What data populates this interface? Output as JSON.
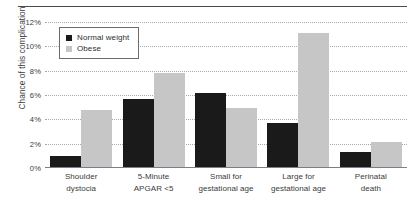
{
  "chart_data": {
    "type": "bar",
    "title": "",
    "xlabel": "",
    "ylabel": "Chance of this complication",
    "ylim": [
      0,
      12
    ],
    "ytick_labels": [
      "12%",
      "10%",
      "8%",
      "6%",
      "4%",
      "2%",
      "0%"
    ],
    "ytick_values": [
      12,
      10,
      8,
      6,
      4,
      2,
      0
    ],
    "grid": true,
    "legend_position": "top-left-inside",
    "categories": [
      "Shoulder dystocia",
      "5-Minute APGAR <5",
      "Small for gestational age",
      "Large for gestational age",
      "Perinatal death"
    ],
    "category_lines": [
      [
        "Shoulder",
        "dystocia"
      ],
      [
        "5-Minute",
        "APGAR <5"
      ],
      [
        "Small for",
        "gestational age"
      ],
      [
        "Large for",
        "gestational age"
      ],
      [
        "Perinatal",
        "death"
      ]
    ],
    "series": [
      {
        "name": "Normal weight",
        "color": "#1a1a1a",
        "values": [
          1.0,
          5.7,
          6.2,
          3.7,
          1.3
        ]
      },
      {
        "name": "Obese",
        "color": "#c6c6c6",
        "values": [
          4.8,
          7.8,
          4.9,
          11.1,
          2.1
        ]
      }
    ]
  },
  "legend": {
    "items": [
      {
        "label": "Normal weight",
        "color": "#1a1a1a"
      },
      {
        "label": "Obese",
        "color": "#c6c6c6"
      }
    ]
  },
  "axis": {
    "y_title": "Chance of this complication"
  }
}
